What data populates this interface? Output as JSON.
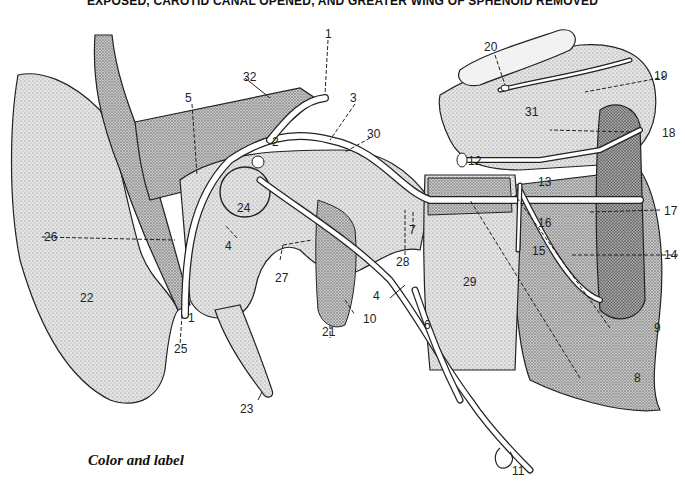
{
  "header": {
    "title": "EXPOSED, CAROTID CANAL OPENED, AND GREATER WING OF SPHENOID REMOVED"
  },
  "caption": "Color and label",
  "colors": {
    "ink": "#111111",
    "stipple_light": "#d6d6d6",
    "stipple_mid": "#bdbdbd",
    "stipple_dark": "#9a9a9a",
    "background": "#ffffff"
  },
  "labels": [
    {
      "id": "1",
      "text": "1"
    },
    {
      "id": "1b",
      "text": "1"
    },
    {
      "id": "2",
      "text": "2"
    },
    {
      "id": "3",
      "text": "3"
    },
    {
      "id": "4a",
      "text": "4"
    },
    {
      "id": "4b",
      "text": "4"
    },
    {
      "id": "5",
      "text": "5"
    },
    {
      "id": "6",
      "text": "6"
    },
    {
      "id": "7",
      "text": "7"
    },
    {
      "id": "8",
      "text": "8"
    },
    {
      "id": "9",
      "text": "9"
    },
    {
      "id": "10",
      "text": "10"
    },
    {
      "id": "11",
      "text": "11"
    },
    {
      "id": "12",
      "text": "12"
    },
    {
      "id": "13",
      "text": "13"
    },
    {
      "id": "14",
      "text": "14"
    },
    {
      "id": "15",
      "text": "15"
    },
    {
      "id": "16",
      "text": "16"
    },
    {
      "id": "17",
      "text": "17"
    },
    {
      "id": "18",
      "text": "18"
    },
    {
      "id": "19",
      "text": "19"
    },
    {
      "id": "20",
      "text": "20"
    },
    {
      "id": "21",
      "text": "21"
    },
    {
      "id": "22",
      "text": "22"
    },
    {
      "id": "23",
      "text": "23"
    },
    {
      "id": "24",
      "text": "24"
    },
    {
      "id": "25",
      "text": "25"
    },
    {
      "id": "26",
      "text": "26"
    },
    {
      "id": "27",
      "text": "27"
    },
    {
      "id": "28",
      "text": "28"
    },
    {
      "id": "29",
      "text": "29"
    },
    {
      "id": "30",
      "text": "30"
    },
    {
      "id": "31",
      "text": "31"
    },
    {
      "id": "32",
      "text": "32"
    }
  ]
}
